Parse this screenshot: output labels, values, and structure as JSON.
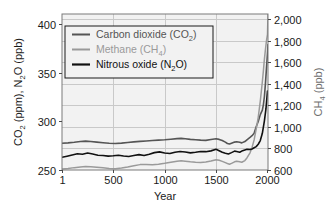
{
  "chart_data": {
    "type": "line",
    "title": "",
    "xlabel": "Year",
    "ylabel": "CO2 (ppm), N2O (ppb)",
    "ylabel_right": "CH4 (ppb)",
    "xlim": [
      1,
      2005
    ],
    "ylim": [
      250,
      410
    ],
    "ylim_right": [
      600,
      2050
    ],
    "grid": true,
    "legend_position": "upper-left",
    "xticks": [
      "1",
      "500",
      "1000",
      "1500",
      "2000"
    ],
    "xtick_values": [
      1,
      500,
      1000,
      1500,
      2000
    ],
    "yticks_left": [
      "250",
      "300",
      "350",
      "400"
    ],
    "ytick_values_left": [
      250,
      300,
      350,
      400
    ],
    "yticks_right": [
      "600",
      "800",
      "1,000",
      "1,200",
      "1,400",
      "1,600",
      "1,800",
      "2,000"
    ],
    "ytick_values_right": [
      600,
      800,
      1000,
      1200,
      1400,
      1600,
      1800,
      2000
    ],
    "series": [
      {
        "name": "Carbon dioxide (CO2)",
        "legend_label": "Carbon dioxide (CO",
        "legend_sub": "2",
        "legend_tail": ")",
        "color": "#555555",
        "axis": "left",
        "unit": "ppm",
        "x": [
          1,
          60,
          120,
          180,
          230,
          280,
          340,
          400,
          460,
          520,
          580,
          640,
          700,
          760,
          820,
          880,
          940,
          1000,
          1060,
          1120,
          1160,
          1200,
          1250,
          1300,
          1350,
          1400,
          1450,
          1500,
          1530,
          1560,
          1590,
          1610,
          1630,
          1650,
          1680,
          1700,
          1730,
          1750,
          1780,
          1800,
          1830,
          1850,
          1870,
          1890,
          1910,
          1930,
          1950,
          1960,
          1970,
          1980,
          1990,
          2000,
          2005
        ],
        "y": [
          277.5,
          277.8,
          278.4,
          279.2,
          279.6,
          279.2,
          278.6,
          278.0,
          277.4,
          277.2,
          277.6,
          278.2,
          278.8,
          279.4,
          279.8,
          280.2,
          280.6,
          281.0,
          281.6,
          282.2,
          282.4,
          282.0,
          281.4,
          281.0,
          280.6,
          280.4,
          281.2,
          282.0,
          281.4,
          280.2,
          278.6,
          277.2,
          276.6,
          277.4,
          278.6,
          279.0,
          278.4,
          277.8,
          279.2,
          281.0,
          283.4,
          285.2,
          287.6,
          294.4,
          299.8,
          306.8,
          311.4,
          316.8,
          325.4,
          338.6,
          354.2,
          369.4,
          378.6
        ]
      },
      {
        "name": "Methane (CH4)",
        "legend_label": "Methane (CH",
        "legend_sub": "4",
        "legend_tail": ")",
        "color": "#9a9a9a",
        "axis": "right",
        "unit": "ppb",
        "x": [
          1,
          60,
          120,
          180,
          230,
          280,
          340,
          400,
          460,
          520,
          580,
          640,
          700,
          760,
          820,
          880,
          940,
          1000,
          1060,
          1120,
          1160,
          1200,
          1250,
          1300,
          1350,
          1400,
          1450,
          1500,
          1530,
          1560,
          1590,
          1610,
          1630,
          1650,
          1680,
          1700,
          1730,
          1750,
          1780,
          1800,
          1830,
          1850,
          1870,
          1890,
          1910,
          1930,
          1950,
          1960,
          1970,
          1980,
          1990,
          2000,
          2005
        ],
        "y": [
          610,
          614,
          622,
          628,
          632,
          630,
          626,
          620,
          614,
          612,
          618,
          628,
          640,
          650,
          652,
          648,
          654,
          662,
          672,
          682,
          686,
          682,
          676,
          672,
          670,
          674,
          684,
          696,
          690,
          680,
          668,
          660,
          654,
          662,
          676,
          682,
          676,
          672,
          688,
          712,
          760,
          810,
          880,
          980,
          1090,
          1240,
          1420,
          1520,
          1630,
          1720,
          1800,
          1860,
          2050
        ]
      },
      {
        "name": "Nitrous oxide (N2O)",
        "legend_label": "Nitrous oxide (N",
        "legend_sub": "2",
        "legend_tail": "O)",
        "color": "#111111",
        "axis": "left",
        "unit": "ppb",
        "x": [
          1,
          50,
          100,
          150,
          200,
          250,
          300,
          350,
          400,
          450,
          500,
          550,
          600,
          650,
          700,
          750,
          800,
          850,
          900,
          950,
          1000,
          1050,
          1100,
          1150,
          1200,
          1250,
          1300,
          1350,
          1400,
          1450,
          1500,
          1530,
          1560,
          1590,
          1620,
          1650,
          1680,
          1700,
          1730,
          1750,
          1780,
          1800,
          1830,
          1850,
          1870,
          1890,
          1910,
          1930,
          1950,
          1970,
          1985,
          2000
        ],
        "y": [
          263.0,
          264.2,
          265.4,
          266.6,
          266.2,
          267.4,
          266.4,
          265.2,
          264.8,
          264.2,
          264.6,
          265.2,
          264.4,
          263.8,
          264.8,
          265.8,
          264.8,
          266.2,
          267.8,
          268.6,
          267.4,
          267.0,
          268.2,
          269.0,
          268.4,
          267.6,
          268.2,
          269.0,
          268.8,
          269.6,
          271.2,
          269.8,
          268.2,
          267.2,
          266.4,
          267.8,
          269.4,
          269.0,
          268.2,
          269.4,
          270.6,
          271.2,
          271.0,
          271.6,
          272.8,
          274.0,
          276.4,
          280.2,
          287.6,
          300.4,
          312.6,
          331.0
        ]
      }
    ]
  },
  "axes": {
    "x_title": "Year",
    "y_left_title_parts": [
      "CO",
      "2",
      " (ppm), N",
      "2",
      "O (ppb)"
    ],
    "y_right_title_parts": [
      "CH",
      "4",
      " (ppb)"
    ]
  },
  "colors": {
    "plot_background": "#f2f2f2",
    "grid": "#c9c9c9",
    "frame": "#7a7a7a",
    "co2": "#555555",
    "ch4": "#9a9a9a",
    "n2o": "#111111",
    "text": "#1a1a1a",
    "text_muted": "#6e6e6e",
    "page_background": "#ffffff"
  }
}
